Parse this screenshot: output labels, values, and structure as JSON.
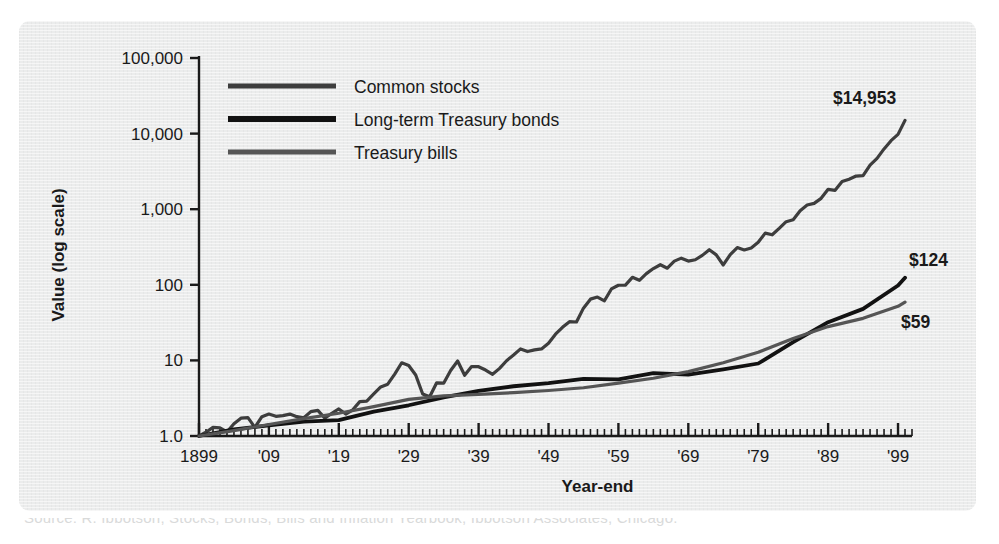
{
  "figure": {
    "background_color": "#ebecec",
    "page_color": "#ffffff",
    "ink_color": "#1a1a1a",
    "partial_caption_below": "Source: R. Ibbotson, Stocks, Bonds, Bills and Inflation Yearbook, Ibbotson Associates, Chicago."
  },
  "chart_data": {
    "type": "line",
    "title": "",
    "xlabel": "Year-end",
    "ylabel": "Value (log scale)",
    "yscale": "log",
    "ylim": [
      1,
      100000
    ],
    "xlim": [
      1899,
      2001
    ],
    "grid": false,
    "legend_position": "upper-left-inside",
    "ytick_labels": [
      "1.0",
      "10",
      "100",
      "1,000",
      "10,000",
      "100,000"
    ],
    "ytick_values": [
      1,
      10,
      100,
      1000,
      10000,
      100000
    ],
    "xtick_labels": [
      "1899",
      "'09",
      "'19",
      "'29",
      "'39",
      "'49",
      "'59",
      "'69",
      "'79",
      "'89",
      "'99"
    ],
    "xtick_values": [
      1899,
      1909,
      1919,
      1929,
      1939,
      1949,
      1959,
      1969,
      1979,
      1989,
      1999
    ],
    "minor_xticks_every": 1,
    "end_labels": [
      {
        "series": "Common stocks",
        "text": "$14,953",
        "value": 14953,
        "year": 2000
      },
      {
        "series": "Long-term Treasury bonds",
        "text": "$124",
        "value": 124,
        "year": 2000
      },
      {
        "series": "Treasury bills",
        "text": "$59",
        "value": 59,
        "year": 2000
      }
    ],
    "series": [
      {
        "name": "Common stocks",
        "color": "#3d3d3d",
        "linewidth": 3.2,
        "x": [
          1899,
          1900,
          1901,
          1902,
          1903,
          1904,
          1905,
          1906,
          1907,
          1908,
          1909,
          1910,
          1911,
          1912,
          1913,
          1914,
          1915,
          1916,
          1917,
          1918,
          1919,
          1920,
          1921,
          1922,
          1923,
          1924,
          1925,
          1926,
          1927,
          1928,
          1929,
          1930,
          1931,
          1932,
          1933,
          1934,
          1935,
          1936,
          1937,
          1938,
          1939,
          1940,
          1941,
          1942,
          1943,
          1944,
          1945,
          1946,
          1947,
          1948,
          1949,
          1950,
          1951,
          1952,
          1953,
          1954,
          1955,
          1956,
          1957,
          1958,
          1959,
          1960,
          1961,
          1962,
          1963,
          1964,
          1965,
          1966,
          1967,
          1968,
          1969,
          1970,
          1971,
          1972,
          1973,
          1974,
          1975,
          1976,
          1977,
          1978,
          1979,
          1980,
          1981,
          1982,
          1983,
          1984,
          1985,
          1986,
          1987,
          1988,
          1989,
          1990,
          1991,
          1992,
          1993,
          1994,
          1995,
          1996,
          1997,
          1998,
          1999,
          2000
        ],
        "y": [
          1.0,
          1.12,
          1.3,
          1.28,
          1.13,
          1.45,
          1.72,
          1.75,
          1.3,
          1.8,
          1.95,
          1.82,
          1.86,
          1.95,
          1.8,
          1.74,
          2.1,
          2.18,
          1.72,
          2.0,
          2.28,
          1.95,
          2.22,
          2.85,
          2.9,
          3.6,
          4.45,
          4.85,
          6.6,
          9.3,
          8.55,
          6.4,
          3.6,
          3.3,
          5.05,
          5.0,
          7.35,
          9.8,
          6.35,
          8.3,
          8.25,
          7.45,
          6.55,
          7.85,
          9.9,
          11.8,
          14.2,
          13.1,
          13.8,
          14.2,
          16.9,
          22.2,
          27.4,
          32.5,
          32.2,
          49.1,
          64.6,
          68.8,
          61.4,
          88.1,
          98.6,
          99.1,
          125.6,
          114.7,
          140.7,
          164.0,
          184.3,
          165.8,
          205.6,
          225.2,
          206.0,
          214.4,
          245.0,
          291.5,
          248.7,
          182.9,
          250.9,
          310.7,
          288.5,
          307.6,
          364.4,
          482.7,
          458.8,
          557.4,
          683.4,
          726.6,
          956.9,
          1135,
          1194,
          1392,
          1833,
          1776,
          2318,
          2494,
          2745,
          2781,
          3825,
          4704,
          6273,
          8065,
          9760,
          14953
        ]
      },
      {
        "name": "Long-term Treasury bonds",
        "color": "#121212",
        "linewidth": 3.8,
        "x": [
          1899,
          1904,
          1909,
          1914,
          1919,
          1924,
          1929,
          1934,
          1939,
          1944,
          1949,
          1954,
          1959,
          1964,
          1969,
          1974,
          1979,
          1984,
          1989,
          1994,
          1999,
          2000
        ],
        "y": [
          1.0,
          1.22,
          1.38,
          1.55,
          1.62,
          2.1,
          2.55,
          3.25,
          3.95,
          4.55,
          5.0,
          5.7,
          5.6,
          6.8,
          6.5,
          7.6,
          9.1,
          17.5,
          32.0,
          48.0,
          98.0,
          124.0
        ]
      },
      {
        "name": "Treasury bills",
        "color": "#555555",
        "linewidth": 3.2,
        "x": [
          1899,
          1904,
          1909,
          1914,
          1919,
          1924,
          1929,
          1934,
          1939,
          1944,
          1949,
          1954,
          1959,
          1964,
          1969,
          1974,
          1979,
          1984,
          1989,
          1994,
          1999,
          2000
        ],
        "y": [
          1.0,
          1.18,
          1.42,
          1.7,
          2.0,
          2.45,
          3.05,
          3.4,
          3.55,
          3.75,
          4.0,
          4.35,
          5.0,
          5.8,
          7.1,
          9.3,
          12.8,
          19.5,
          28.0,
          36.0,
          52.0,
          59.0
        ]
      }
    ]
  },
  "legend": {
    "items": [
      {
        "label": "Common stocks",
        "color": "#3d3d3d"
      },
      {
        "label": "Long-term Treasury bonds",
        "color": "#121212"
      },
      {
        "label": "Treasury bills",
        "color": "#555555"
      }
    ]
  }
}
